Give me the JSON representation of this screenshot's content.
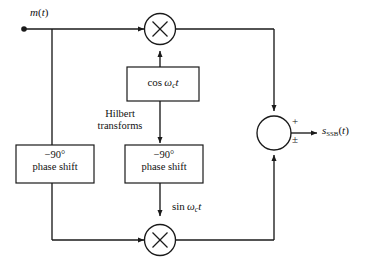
{
  "diagram": {
    "stroke_color": "#1a1a1a",
    "text_color": "#111111",
    "background": "#ffffff",
    "input": {
      "label_m": "m",
      "label_paren_open": "(",
      "label_t": "t",
      "label_paren_close": ")"
    },
    "annotation": {
      "hilbert_line1": "Hilbert",
      "hilbert_line2": "transforms"
    },
    "blocks": {
      "phase_shift_left": {
        "line1": "−90°",
        "line2": "phase shift"
      },
      "phase_shift_middle": {
        "line1": "−90°",
        "line2": "phase shift"
      },
      "carrier_cos": {
        "fn": "cos",
        "omega": "ω",
        "subscript": "c",
        "var": "t"
      }
    },
    "carrier_sin": {
      "fn": "sin",
      "omega": "ω",
      "subscript": "c",
      "var": "t"
    },
    "multipliers": {
      "top_symbol": "×",
      "bottom_symbol": "×"
    },
    "summer": {
      "sign_top": "+",
      "sign_bottom": "±"
    },
    "output": {
      "symbol": "s",
      "subscript": "SSB",
      "paren_open": "(",
      "var": "t",
      "paren_close": ")"
    }
  }
}
